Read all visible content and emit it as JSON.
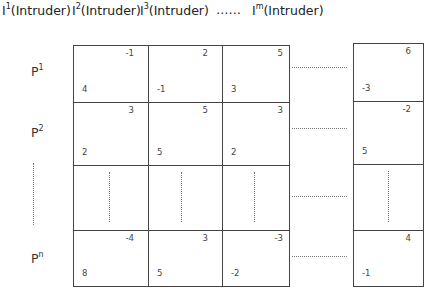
{
  "header": {
    "columns": [
      {
        "base": "I",
        "sup": "1",
        "suffix": "(Intruder)"
      },
      {
        "base": "I",
        "sup": "2",
        "suffix": "(Intruder)"
      },
      {
        "base": "I",
        "sup": "3",
        "suffix": "(Intruder)"
      },
      {
        "base": "I",
        "sup": "m",
        "suffix": "(Intruder)"
      }
    ],
    "ellipsis": "……"
  },
  "rows": [
    {
      "base": "P",
      "sup": "1"
    },
    {
      "base": "P",
      "sup": "2"
    },
    {
      "base": "",
      "sup": ""
    },
    {
      "base": "P",
      "sup": "n"
    }
  ],
  "payoffs": {
    "row1": [
      {
        "top": "-1",
        "bot": "4"
      },
      {
        "top": "2",
        "bot": "-1"
      },
      {
        "top": "5",
        "bot": "3"
      },
      {
        "top": "6",
        "bot": "-3"
      }
    ],
    "row2": [
      {
        "top": "3",
        "bot": "2"
      },
      {
        "top": "5",
        "bot": "5"
      },
      {
        "top": "3",
        "bot": "2"
      },
      {
        "top": "-2",
        "bot": "5"
      }
    ],
    "rown": [
      {
        "top": "-4",
        "bot": "8"
      },
      {
        "top": "3",
        "bot": "5"
      },
      {
        "top": "-3",
        "bot": "-2"
      },
      {
        "top": "4",
        "bot": "-1"
      }
    ]
  }
}
